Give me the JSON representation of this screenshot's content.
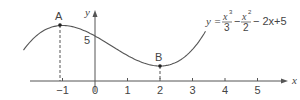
{
  "chart_data": {
    "type": "line",
    "title": "",
    "equation": {
      "y": "y =",
      "t1n": "x",
      "t1e": "3",
      "t1d": "3",
      "op1": "−",
      "t2n": "x",
      "t2e": "2",
      "t2d": "2",
      "rest": "− 2x+5"
    },
    "xlabel": "x",
    "ylabel": "y",
    "xticks": [
      "−1",
      "0",
      "1",
      "2",
      "3",
      "4",
      "5"
    ],
    "xtick_values": [
      -1,
      0,
      1,
      2,
      3,
      4,
      5
    ],
    "ytick_label": "5",
    "xlim": [
      -2.3,
      5.9
    ],
    "ylim": [
      0,
      7
    ],
    "grid": false,
    "series": [
      {
        "name": "y = x^3/3 - x^2/2 - 2x + 5",
        "function": "x^3/3 - x^2/2 - 2x + 5",
        "x_range": [
          -2.2,
          3.4
        ]
      }
    ],
    "points": [
      {
        "label": "A",
        "x": -1,
        "y": 6.17,
        "type": "local maximum"
      },
      {
        "label": "B",
        "x": 2,
        "y": 1.67,
        "type": "local minimum"
      }
    ]
  }
}
